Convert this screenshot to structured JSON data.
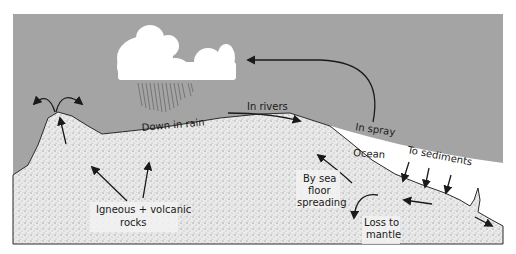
{
  "diagram": {
    "colors": {
      "sky": "#a4a4a4",
      "land": "#e9e9e9",
      "ocean": "#ffffff",
      "line": "#1a1a1a",
      "cloud": "#ffffff",
      "rain": "#6a6a6a"
    },
    "labels": {
      "down_in_rain": "Down in rain",
      "in_rivers": "In rivers",
      "in_spray": "In spray",
      "ocean": "Ocean",
      "to_sediments": "To sediments",
      "by_sea_floor_spreading_1": "By sea",
      "by_sea_floor_spreading_2": "floor",
      "by_sea_floor_spreading_3": "spreading",
      "loss_to_mantle_1": "Loss to",
      "loss_to_mantle_2": "mantle",
      "igneous_1": "Igneous + volcanic",
      "igneous_2": "rocks"
    },
    "elements": [
      {
        "name": "cloud",
        "type": "icon"
      },
      {
        "name": "rain",
        "type": "icon"
      },
      {
        "name": "volcano",
        "type": "landform"
      },
      {
        "name": "land",
        "type": "region"
      },
      {
        "name": "ocean",
        "type": "region"
      },
      {
        "name": "sky",
        "type": "region"
      }
    ]
  }
}
